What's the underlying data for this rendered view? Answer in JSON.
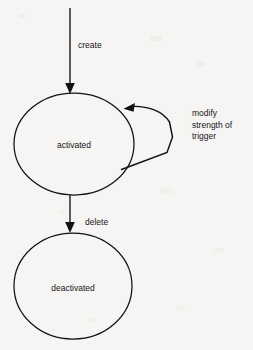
{
  "diagram": {
    "type": "state-machine",
    "background_color": "#f6f5f3",
    "stroke_color": "#111115",
    "text_color": "#16161a",
    "states": [
      {
        "id": "activated",
        "label": "activated",
        "shape": "ellipse",
        "cx": 74,
        "cy": 144,
        "rx": 60,
        "ry": 51
      },
      {
        "id": "deactivated",
        "label": "deactivated",
        "shape": "ellipse",
        "cx": 73,
        "cy": 286,
        "rx": 59,
        "ry": 53
      }
    ],
    "transitions": [
      {
        "id": "create",
        "label": "create",
        "from": "start",
        "to": "activated",
        "label_x": 78,
        "label_y": 48,
        "kind": "straight-down"
      },
      {
        "id": "modify-strength-of-trigger",
        "label_lines": [
          "modify",
          "strength of",
          "trigger"
        ],
        "from": "activated",
        "to": "activated",
        "label_x": 192,
        "label_y": 116,
        "kind": "self-loop"
      },
      {
        "id": "delete",
        "label": "delete",
        "from": "activated",
        "to": "deactivated",
        "label_x": 85,
        "label_y": 225,
        "kind": "straight-down"
      }
    ]
  }
}
